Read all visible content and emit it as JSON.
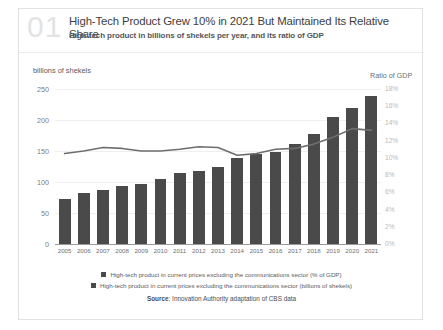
{
  "header": {
    "number": "01",
    "title": "High-Tech Product Grew 10% in 2021 But Maintained Its Relative Share",
    "subtitle": "High-tech product in billions of shekels per year, and its ratio of GDP"
  },
  "source": {
    "prefix": "Source",
    "separator": ": ",
    "text": "Innovation Authority adaptation of CBS data"
  },
  "chart_data": {
    "type": "bar",
    "title": "High-Tech Product Grew 10% in 2021 But Maintained Its Relative Share",
    "subtitle": "High-tech product in billions of shekels per year, and its ratio of GDP",
    "xlabel": "",
    "ylabel": "billions of shekels",
    "y2label": "Ratio of GDP",
    "ylim": [
      0,
      250
    ],
    "y2lim": [
      0,
      18
    ],
    "yticks": [
      "0",
      "50",
      "100",
      "150",
      "200",
      "250"
    ],
    "ytick_values": [
      0,
      50,
      100,
      150,
      200,
      250
    ],
    "y2ticks": [
      "0%",
      "2%",
      "4%",
      "6%",
      "8%",
      "10%",
      "12%",
      "14%",
      "16%",
      "18%"
    ],
    "y2tick_values": [
      0,
      2,
      4,
      6,
      8,
      10,
      12,
      14,
      16,
      18
    ],
    "grid": true,
    "legend_position": "bottom",
    "categories": [
      "2005",
      "2006",
      "2007",
      "2008",
      "2009",
      "2010",
      "2011",
      "2012",
      "2013",
      "2014",
      "2015",
      "2016",
      "2017",
      "2018",
      "2019",
      "2020",
      "2021"
    ],
    "series": [
      {
        "name": "High-tech product in current prices excluding the communications sector (% of GDP)",
        "type": "line",
        "axis": "right",
        "color": "#6e6e6e",
        "values": [
          10.5,
          10.8,
          11.2,
          11.1,
          10.8,
          10.8,
          11.0,
          11.3,
          11.2,
          10.3,
          10.5,
          11.0,
          11.1,
          11.6,
          12.4,
          13.4,
          13.2
        ]
      },
      {
        "name": "High-tech product in current prices excluding the communications sector (billions of shekels)",
        "type": "bar",
        "axis": "left",
        "color": "#4a4a4a",
        "values": [
          72,
          82,
          87,
          93,
          97,
          105,
          114,
          118,
          125,
          138,
          145,
          148,
          162,
          178,
          205,
          220,
          238
        ]
      }
    ]
  }
}
